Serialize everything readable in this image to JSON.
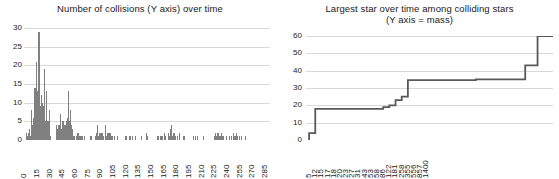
{
  "left_chart": {
    "title": "Number of collisions (Y axis) over time",
    "y_ticks": [
      "0",
      "5",
      "10",
      "15",
      "20",
      "25",
      "30"
    ],
    "x_ticks": [
      "0",
      "15",
      "30",
      "45",
      "60",
      "75",
      "90",
      "105",
      "120",
      "135",
      "150",
      "165",
      "180",
      "195",
      "210",
      "225",
      "240",
      "255",
      "270",
      "285"
    ]
  },
  "right_chart": {
    "title": "Largest star over time among colliding stars",
    "subtitle": "(Y axis = mass)",
    "y_ticks": [
      "0",
      "10",
      "20",
      "30",
      "40",
      "50",
      "60"
    ],
    "x_ticks": [
      "5",
      "12",
      "15",
      "17",
      "18",
      "20",
      "23",
      "27",
      "31",
      "43",
      "53",
      "58",
      "86",
      "122",
      "181",
      "258",
      "355",
      "556",
      "857",
      "1400"
    ]
  },
  "chart_data": [
    {
      "type": "bar",
      "title": "Number of collisions (Y axis) over time",
      "xlabel": "",
      "ylabel": "",
      "ylim": [
        0,
        30
      ],
      "grid": true,
      "legend": "none",
      "bar_color": "#808080",
      "x_tick_labels": [
        "0",
        "15",
        "30",
        "45",
        "60",
        "75",
        "90",
        "105",
        "120",
        "135",
        "150",
        "165",
        "180",
        "195",
        "210",
        "225",
        "240",
        "255",
        "270",
        "285"
      ],
      "x_tick_every": 15,
      "categories": [
        0,
        1,
        2,
        3,
        4,
        5,
        6,
        7,
        8,
        9,
        10,
        11,
        12,
        13,
        14,
        15,
        16,
        17,
        18,
        19,
        20,
        21,
        22,
        23,
        24,
        25,
        26,
        27,
        28,
        29,
        30,
        31,
        32,
        33,
        34,
        35,
        36,
        37,
        38,
        39,
        40,
        41,
        42,
        43,
        44,
        45,
        46,
        47,
        48,
        49,
        50,
        51,
        52,
        53,
        54,
        55,
        56,
        57,
        58,
        59,
        60,
        61,
        62,
        63,
        64,
        65,
        66,
        67,
        68,
        69,
        70,
        71,
        72,
        73,
        74,
        75,
        76,
        77,
        78,
        79,
        80,
        81,
        82,
        83,
        84,
        85,
        86,
        87,
        88,
        89,
        90,
        91,
        92,
        93,
        94,
        95,
        96,
        97,
        98,
        99,
        100,
        101,
        102,
        103,
        104,
        105,
        106,
        107,
        108,
        109,
        110,
        111,
        112,
        113,
        114,
        115,
        116,
        117,
        118,
        119,
        120,
        121,
        122,
        123,
        124,
        125,
        126,
        127,
        128,
        129,
        130,
        131,
        132,
        133,
        134,
        135,
        136,
        137,
        138,
        139,
        140,
        141,
        142,
        143,
        144,
        145,
        146,
        147,
        148,
        149,
        150,
        151,
        152,
        153,
        154,
        155,
        156,
        157,
        158,
        159,
        160,
        161,
        162,
        163,
        164,
        165,
        166,
        167,
        168,
        169,
        170,
        171,
        172,
        173,
        174,
        175,
        176,
        177,
        178,
        179,
        180,
        181,
        182,
        183,
        184,
        185,
        186,
        187,
        188,
        189,
        190,
        191,
        192,
        193,
        194,
        195,
        196,
        197,
        198,
        199,
        200,
        201,
        202,
        203,
        204,
        205,
        206,
        207,
        208,
        209,
        210,
        211,
        212,
        213,
        214,
        215,
        216,
        217,
        218,
        219,
        220,
        221,
        222,
        223,
        224,
        225,
        226,
        227,
        228,
        229,
        230,
        231,
        232,
        233,
        234,
        235,
        236,
        237,
        238,
        239,
        240,
        241,
        242,
        243,
        244,
        245,
        246,
        247,
        248,
        249,
        250,
        251,
        252,
        253,
        254,
        255,
        256,
        257,
        258,
        259,
        260,
        261,
        262,
        263,
        264,
        265,
        266,
        267,
        268,
        269,
        270,
        271,
        272,
        273,
        274,
        275,
        276,
        277,
        278,
        279,
        280,
        281,
        282,
        283,
        284,
        285,
        286,
        287,
        288,
        289,
        290
      ],
      "values": [
        0,
        0,
        2,
        1,
        0,
        2,
        3,
        1,
        8,
        4,
        5,
        6,
        14,
        14,
        21,
        13,
        9,
        29,
        29,
        9,
        12,
        10,
        9,
        19,
        7,
        5,
        13,
        5,
        5,
        8,
        2,
        1,
        0,
        0,
        0,
        0,
        0,
        0,
        4,
        3,
        4,
        4,
        7,
        6,
        3,
        5,
        5,
        4,
        4,
        4,
        5,
        6,
        13,
        5,
        8,
        4,
        2,
        3,
        1,
        1,
        0,
        0,
        1,
        2,
        2,
        1,
        1,
        1,
        1,
        1,
        0,
        1,
        0,
        0,
        0,
        0,
        0,
        0,
        1,
        1,
        0,
        0,
        0,
        0,
        1,
        2,
        4,
        1,
        1,
        2,
        2,
        2,
        2,
        1,
        1,
        0,
        4,
        1,
        2,
        2,
        1,
        2,
        2,
        1,
        1,
        0,
        0,
        1,
        0,
        0,
        1,
        0,
        0,
        0,
        0,
        0,
        0,
        0,
        0,
        0,
        1,
        1,
        0,
        0,
        1,
        1,
        0,
        0,
        1,
        0,
        0,
        1,
        0,
        0,
        0,
        0,
        0,
        0,
        1,
        0,
        0,
        0,
        0,
        0,
        0,
        2,
        1,
        0,
        0,
        0,
        0,
        0,
        0,
        0,
        0,
        0,
        0,
        0,
        1,
        1,
        0,
        1,
        1,
        1,
        0,
        0,
        2,
        1,
        0,
        0,
        2,
        1,
        1,
        3,
        4,
        1,
        2,
        1,
        2,
        1,
        0,
        1,
        0,
        2,
        1,
        0,
        0,
        0,
        1,
        0,
        1,
        0,
        0,
        0,
        0,
        0,
        0,
        0,
        0,
        0,
        1,
        0,
        0,
        1,
        0,
        1,
        0,
        0,
        0,
        0,
        0,
        0,
        1,
        0,
        0,
        0,
        0,
        0,
        0,
        0,
        0,
        0,
        0,
        0,
        0,
        1,
        2,
        1,
        1,
        2,
        2,
        1,
        1,
        2,
        1,
        0,
        1,
        0,
        0,
        1,
        0,
        0,
        0,
        1,
        0,
        1,
        0,
        0,
        2,
        1,
        1,
        2,
        1,
        0,
        0,
        1,
        0,
        1,
        0,
        0,
        0,
        0,
        1,
        0,
        0,
        0,
        0,
        0,
        0,
        0,
        0,
        0,
        0,
        0,
        0,
        0,
        0,
        0,
        0,
        0,
        0,
        0,
        0,
        0,
        0,
        0,
        0,
        0,
        0,
        0,
        0,
        0
      ]
    },
    {
      "type": "line",
      "line_style": "step",
      "title": "Largest star over time among colliding stars",
      "subtitle": "(Y axis = mass)",
      "xlabel": "",
      "ylabel": "mass",
      "ylim": [
        0,
        60
      ],
      "grid": true,
      "legend": "none",
      "line_color": "#595959",
      "x_tick_labels": [
        "5",
        "12",
        "15",
        "17",
        "18",
        "20",
        "23",
        "27",
        "31",
        "43",
        "53",
        "58",
        "86",
        "122",
        "181",
        "258",
        "355",
        "556",
        "857",
        "1400"
      ],
      "x": [
        0,
        1,
        2,
        3,
        4,
        5,
        6,
        7,
        8,
        9,
        10,
        11,
        12,
        13,
        14,
        15,
        16,
        17,
        18,
        19,
        20,
        21,
        22,
        23,
        24,
        25,
        26,
        27,
        28,
        29,
        30,
        31,
        32,
        33,
        34,
        35,
        36,
        37,
        38,
        39
      ],
      "values": [
        4,
        18,
        18,
        18,
        18,
        18,
        18,
        18,
        18,
        18,
        18,
        18,
        19,
        20,
        23,
        25,
        34.5,
        34.5,
        34.5,
        34.5,
        34.5,
        34.5,
        34.5,
        34.5,
        34.5,
        34.5,
        34.5,
        35,
        35,
        35,
        35,
        35,
        35,
        35,
        35,
        43,
        43,
        60,
        60,
        60
      ]
    }
  ]
}
